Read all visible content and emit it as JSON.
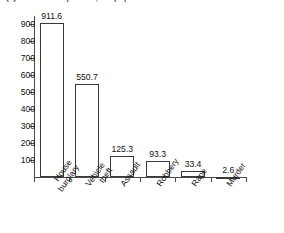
{
  "caption": "(a) Crime rates per 100,000 population",
  "chart_data": {
    "type": "bar",
    "title": "(a) Crime rates per 100,000 population",
    "xlabel": "",
    "ylabel": "",
    "ylim": [
      0,
      950
    ],
    "grid": false,
    "legend": "none",
    "ytick_labels": [
      "900",
      "800",
      "700",
      "600",
      "500",
      "400",
      "300",
      "200",
      "100"
    ],
    "ytick_values": [
      900,
      800,
      700,
      600,
      500,
      400,
      300,
      200,
      100
    ],
    "categories": [
      "House burglary",
      "Vehicle theft",
      "Assault",
      "Robbery",
      "Rape",
      "Murder"
    ],
    "category_lines": [
      [
        "House",
        "burglary"
      ],
      [
        "Vehicle",
        "theft"
      ],
      [
        "Assault"
      ],
      [
        "Robbery"
      ],
      [
        "Rape"
      ],
      [
        "Murder"
      ]
    ],
    "values": [
      911.6,
      550.7,
      125.3,
      93.3,
      33.4,
      2.6
    ],
    "value_labels": [
      "911.6",
      "550.7",
      "125.3",
      "93.3",
      "33.4",
      "2.6"
    ],
    "bar_facecolor": "#ffffff",
    "bar_edgecolor": "#3a3a3a",
    "axis_color": "#4a4a4a"
  }
}
